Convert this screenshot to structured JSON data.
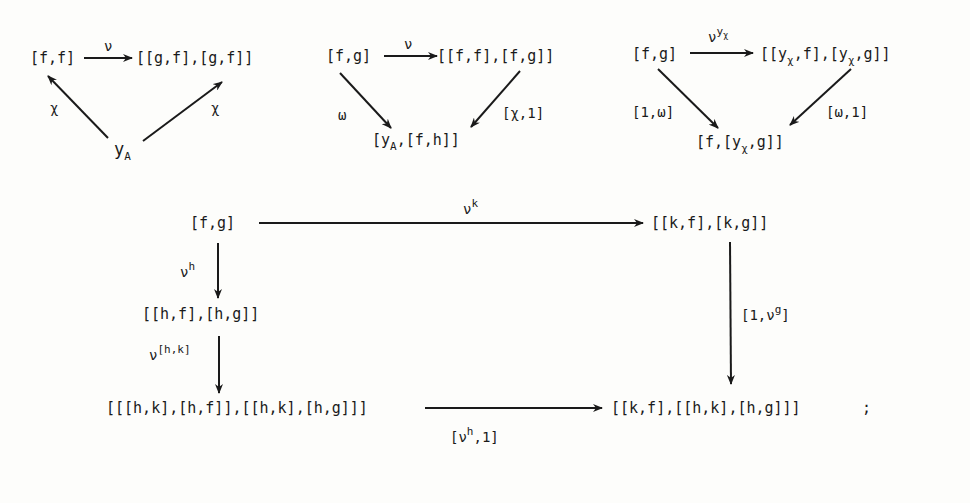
{
  "diagram1": {
    "top_left": "[f,f]",
    "top_right": "[[g,f],[g,f]]",
    "bottom": "y",
    "bottom_sub": "A",
    "top_arrow_label": "ν",
    "left_arrow_label": "χ",
    "right_arrow_label": "χ"
  },
  "diagram2": {
    "top_left": "[f,g]",
    "top_right": "[[f,f],[f,g]]",
    "bottom_pre": "[y",
    "bottom_sub": "A",
    "bottom_post": ",[f,h]]",
    "top_arrow_label": "ν",
    "left_arrow_label": "ω",
    "right_arrow_label": "[χ,1]"
  },
  "diagram3": {
    "top_left": "[f,g]",
    "top_right_parts": [
      "[[y",
      "χ",
      ",f],[y",
      "χ",
      ",g]]"
    ],
    "bottom_parts": [
      "[f,[y",
      "χ",
      ",g]]"
    ],
    "top_arrow_label": "ν",
    "top_arrow_sup": "y",
    "top_arrow_sup_sub": "χ",
    "left_arrow_label": "[1,ω]",
    "right_arrow_label": "[ω,1]"
  },
  "diagram4": {
    "top_left": "[f,g]",
    "top_right": "[[k,f],[k,g]]",
    "middle_left": "[[h,f],[h,g]]",
    "bottom_left": "[[[h,k],[h,f]],[[h,k],[h,g]]]",
    "bottom_right": "[[k,f],[[h,k],[h,g]]]",
    "trailing": ";",
    "top_arrow_label": "ν",
    "top_arrow_sup": "k",
    "down1_label": "ν",
    "down1_sup": "h",
    "down2_label": "ν",
    "down2_sup": "[h,k]",
    "right_down_pre": "[1,ν",
    "right_down_sup": "g",
    "right_down_post": "]",
    "bottom_arrow_pre": "[ν",
    "bottom_arrow_sup": "h",
    "bottom_arrow_post": ",1]"
  }
}
